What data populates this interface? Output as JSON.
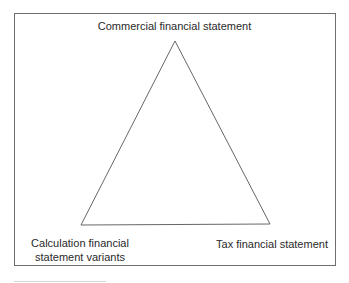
{
  "diagram": {
    "type": "triangle",
    "nodes": [
      {
        "id": "top",
        "label": "Commercial financial statement"
      },
      {
        "id": "bottom-left",
        "label_lines": [
          "Calculation financial",
          "statement variants"
        ]
      },
      {
        "id": "bottom-right",
        "label": "Tax financial statement"
      }
    ],
    "colors": {
      "line": "#555555",
      "frame": "#6e6e6e",
      "text": "#2a2a2a"
    }
  }
}
